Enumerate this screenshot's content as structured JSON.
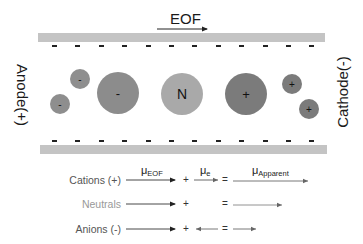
{
  "eof": {
    "label": "EOF",
    "direction": "right"
  },
  "electrodes": {
    "left": "Anode(+)",
    "right": "Cathode(-)"
  },
  "wall_charge_symbol": "-",
  "wall_charge_count_per_wall": 12,
  "ions": [
    {
      "type": "anion",
      "size": "small",
      "symbol": "-",
      "cx": 60,
      "cy": 104,
      "r": 10,
      "color": "#8e8e8e"
    },
    {
      "type": "anion",
      "size": "small",
      "symbol": "-",
      "cx": 80,
      "cy": 79,
      "r": 10,
      "color": "#8e8e8e"
    },
    {
      "type": "anion",
      "size": "large",
      "symbol": "-",
      "cx": 118,
      "cy": 93,
      "r": 21,
      "color": "#8c8c8c"
    },
    {
      "type": "neutral",
      "size": "large",
      "symbol": "N",
      "cx": 182,
      "cy": 94,
      "r": 21,
      "color": "#a9a9a9"
    },
    {
      "type": "cation",
      "size": "large",
      "symbol": "+",
      "cx": 246,
      "cy": 94,
      "r": 21,
      "color": "#7b7b7b"
    },
    {
      "type": "cation",
      "size": "small",
      "symbol": "+",
      "cx": 292,
      "cy": 84,
      "r": 10,
      "color": "#7b7b7b"
    },
    {
      "type": "cation",
      "size": "small",
      "symbol": "+",
      "cx": 309,
      "cy": 109,
      "r": 10,
      "color": "#7b7b7b"
    }
  ],
  "equation": {
    "headers": {
      "eof": {
        "base": "μ",
        "sub": "EOF"
      },
      "e": {
        "base": "μ",
        "sub": "e"
      },
      "apparent": {
        "base": "μ",
        "sub": "Apparent"
      }
    },
    "plus": "+",
    "equals": "=",
    "rows": [
      {
        "label": "Cations (+)",
        "label_color": "#555555",
        "eof_arrow": "right-long",
        "e_arrow": "right-short",
        "apparent_arrow": "right-longest"
      },
      {
        "label": "Neutrals",
        "label_color": "#999999",
        "eof_arrow": "right-long",
        "e_arrow": "none",
        "apparent_arrow": "right-medium"
      },
      {
        "label": "Anions (-)",
        "label_color": "#555555",
        "eof_arrow": "right-long",
        "e_arrow": "left-short",
        "apparent_arrow": "right-short"
      }
    ]
  },
  "colors": {
    "wall": "#c4c4c4",
    "text": "#1a1a1a",
    "arrow": "#222222"
  }
}
